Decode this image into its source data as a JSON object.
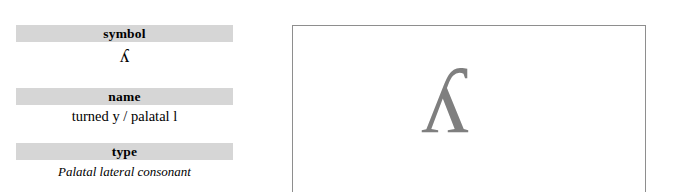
{
  "page": {
    "background_color": "#ffffff",
    "width": 676,
    "height": 192
  },
  "info_panel": {
    "label_bar_color": "#d6d6d6",
    "fields": [
      {
        "label": "symbol",
        "value": "ʎ"
      },
      {
        "label": "name",
        "value": "turned y / palatal l"
      },
      {
        "label": "type",
        "value": "Palatal lateral consonant"
      }
    ]
  },
  "glyph_panel": {
    "glyph": "ʎ",
    "glyph_color": "#7f7f7f",
    "border_color": "#8e8e8e"
  }
}
